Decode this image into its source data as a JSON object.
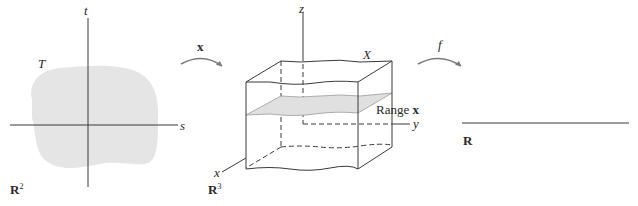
{
  "figure": {
    "panels": [
      {
        "id": "domain",
        "space_label": "R",
        "space_exp": "2",
        "region_label": "T",
        "axis_h": "s",
        "axis_v": "t"
      },
      {
        "id": "codomain",
        "space_label": "R",
        "space_exp": "3",
        "region_label": "X",
        "surface_label": "Range",
        "surface_label_bold": "x",
        "axis_x": "x",
        "axis_y": "y",
        "axis_z": "z"
      },
      {
        "id": "target",
        "space_label": "R"
      }
    ],
    "arrows": [
      {
        "label": "x",
        "from": "domain",
        "to": "codomain"
      },
      {
        "label": "f",
        "from": "codomain",
        "to": "target"
      }
    ]
  },
  "colors": {
    "line": "#3a3a3a",
    "fill": "#e4e4e4",
    "arrow": "#7a7a7a"
  }
}
